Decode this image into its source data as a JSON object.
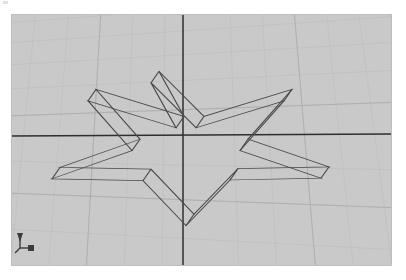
{
  "app": {
    "kind": "3d-cad-viewport",
    "background_color": "#ffffff"
  },
  "viewport": {
    "name": "persp",
    "label": "persp",
    "background_color": "#c9c9c9",
    "border_color": "#bdbdbd",
    "width": 381,
    "height": 252,
    "projection": "perspective",
    "display_mode": "wireframe",
    "grid": {
      "visible": true,
      "minor_color": "#bfbfbf",
      "major_color": "#b0b0b0",
      "axis_color": "#2b2b2b",
      "horizon_y": 120,
      "vanishing_x": 171,
      "rows": 11,
      "cols": 13
    },
    "axes": {
      "x_axis_label": "x",
      "y_axis_label": "y",
      "z_axis_label": "z",
      "origin_x": 171,
      "origin_y": 120
    }
  },
  "gizmo": {
    "name": "axis-indicator",
    "labels": [
      "y",
      "z",
      "x"
    ],
    "color": "#3c3c3c"
  },
  "model": {
    "name": "extruded-star",
    "sides": 5,
    "wire_color": "#4a4a4a",
    "wire_width": 0.85,
    "top_outline": [
      [
        147,
        94
      ],
      [
        192,
        169
      ],
      [
        280,
        124
      ],
      [
        236,
        207
      ],
      [
        317,
        253
      ],
      [
        226,
        256
      ],
      [
        182,
        332
      ],
      [
        139,
        257
      ],
      [
        48,
        254
      ],
      [
        128,
        207
      ],
      [
        84,
        124
      ],
      [
        172,
        169
      ]
    ],
    "bottom_outline": [
      [
        139,
        113
      ],
      [
        184,
        188
      ],
      [
        272,
        143
      ],
      [
        228,
        226
      ],
      [
        309,
        272
      ],
      [
        218,
        275
      ],
      [
        174,
        351
      ],
      [
        131,
        276
      ],
      [
        40,
        273
      ],
      [
        120,
        226
      ],
      [
        76,
        143
      ],
      [
        164,
        188
      ]
    ],
    "star_points": [
      {
        "id": "tip-top",
        "top": [
          147,
          94
        ],
        "bottom": [
          139,
          113
        ]
      },
      {
        "id": "tip-upper-right",
        "top": [
          317,
          253
        ],
        "bottom": [
          309,
          272
        ]
      },
      {
        "id": "tip-lower-right",
        "top": [
          182,
          332
        ],
        "bottom": [
          174,
          351
        ]
      },
      {
        "id": "tip-lower-left",
        "top": [
          48,
          254
        ],
        "bottom": [
          40,
          273
        ]
      },
      {
        "id": "tip-upper-left",
        "top": [
          84,
          124
        ],
        "bottom": [
          76,
          143
        ]
      }
    ]
  }
}
